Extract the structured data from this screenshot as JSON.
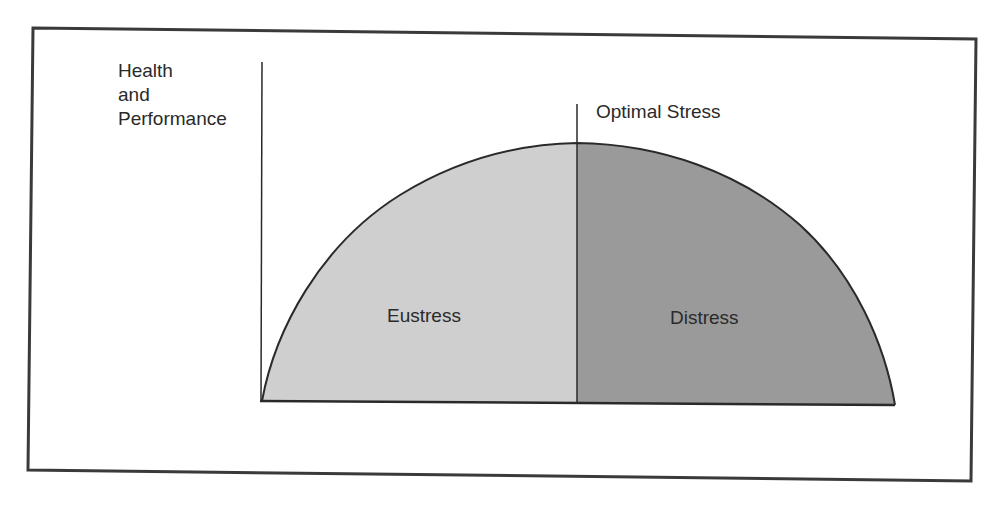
{
  "diagram": {
    "type": "stress-performance curve",
    "y_axis_label": [
      "Health",
      "and",
      "Performance"
    ],
    "marker_label": "Optimal Stress",
    "regions": [
      {
        "label": "Eustress",
        "position": "left of optimal",
        "fill": "#cfcfcf"
      },
      {
        "label": "Distress",
        "position": "right of optimal",
        "fill": "#9a9a9a"
      }
    ],
    "colors": {
      "frame": "#3a3a3a",
      "curve": "#2a2a2a",
      "text": "#2a2a2a",
      "eustress_fill": "#cfcfcf",
      "distress_fill": "#9a9a9a"
    }
  }
}
